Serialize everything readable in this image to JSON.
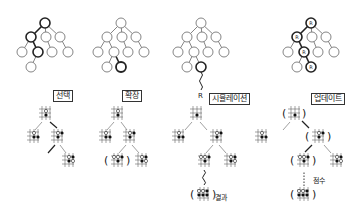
{
  "diagram": {
    "stages": [
      {
        "id": "selection",
        "label": "선택"
      },
      {
        "id": "expansion",
        "label": "확장"
      },
      {
        "id": "simulation",
        "label": "시뮬레이션",
        "leaf_marker": "R",
        "result_label": "결과"
      },
      {
        "id": "update",
        "label": "업데이트",
        "node_marker": "R",
        "score_label": "점수"
      }
    ],
    "colors": {
      "line": "#555555",
      "highlight": "#222222",
      "node_fill": "#ffffff",
      "stone_black": "#111111",
      "stone_white": "#ffffff"
    }
  }
}
